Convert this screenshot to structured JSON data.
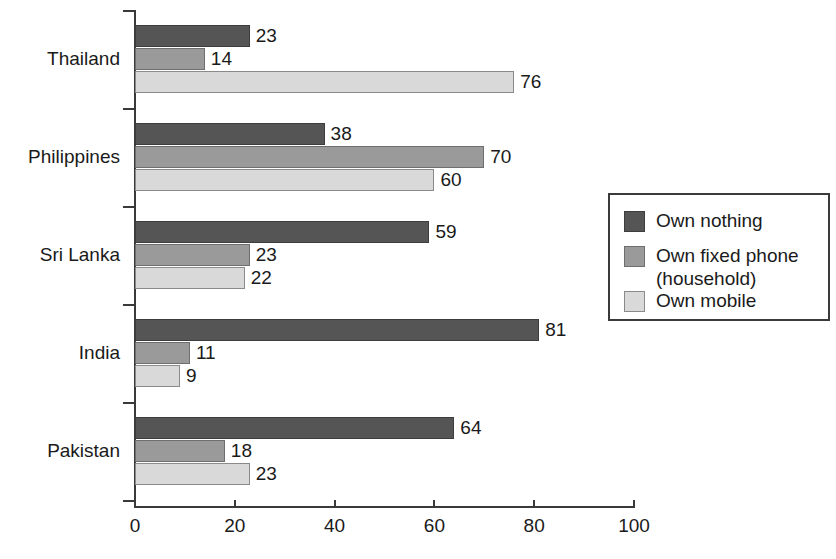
{
  "chart_data": {
    "type": "bar",
    "orientation": "horizontal",
    "title": "",
    "subtitle": "",
    "xlabel": "",
    "ylabel": "",
    "xlim": [
      0,
      100
    ],
    "xticks": [
      0,
      20,
      40,
      60,
      80,
      100
    ],
    "xtick_labels": [
      "0",
      "20",
      "40",
      "60",
      "80",
      "100"
    ],
    "grid": false,
    "legend_position": "right",
    "categories": [
      "Thailand",
      "Philippines",
      "Sri Lanka",
      "India",
      "Pakistan"
    ],
    "series": [
      {
        "name": "Own nothing",
        "color": "#555555",
        "values": [
          23,
          38,
          59,
          81,
          64
        ]
      },
      {
        "name": "Own fixed phone (household)",
        "color": "#9a9a9a",
        "values": [
          14,
          70,
          23,
          11,
          18
        ]
      },
      {
        "name": "Own mobile",
        "color": "#d9d9d9",
        "values": [
          76,
          60,
          22,
          9,
          23
        ]
      }
    ],
    "data_labels": {
      "Thailand": [
        "23",
        "14",
        "76"
      ],
      "Philippines": [
        "38",
        "70",
        "60"
      ],
      "Sri Lanka": [
        "59",
        "23",
        "22"
      ],
      "India": [
        "81",
        "11",
        "9"
      ],
      "Pakistan": [
        "64",
        "18",
        "23"
      ]
    }
  },
  "legend": {
    "items": [
      {
        "label": "Own nothing",
        "color": "#555555"
      },
      {
        "label": "Own fixed phone\n(household)",
        "color": "#9a9a9a"
      },
      {
        "label": "Own mobile",
        "color": "#d9d9d9"
      }
    ]
  },
  "axis": {
    "x_tick_labels": [
      "0",
      "20",
      "40",
      "60",
      "80",
      "100"
    ],
    "y_tick_labels": [
      "Thailand",
      "Philippines",
      "Sri Lanka",
      "India",
      "Pakistan"
    ]
  }
}
